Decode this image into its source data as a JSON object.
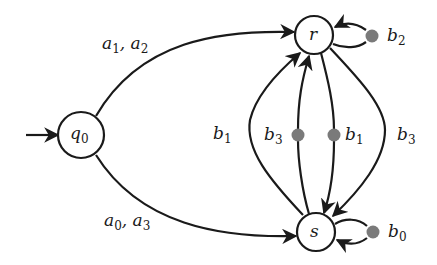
{
  "diagram": {
    "type": "state-transition-diagram",
    "colors": {
      "stroke": "#1a1a1a",
      "choice_dot": "#7a7a7a",
      "background": "#ffffff"
    },
    "nodes": [
      {
        "id": "q0",
        "label": "q",
        "sub": "0",
        "initial": true
      },
      {
        "id": "r",
        "label": "r",
        "sub": ""
      },
      {
        "id": "s",
        "label": "s",
        "sub": ""
      }
    ],
    "edges": [
      {
        "from": "q0",
        "to": "r",
        "label": "a",
        "label_text": "a1, a2",
        "parts": [
          {
            "l": "a",
            "s": "1"
          },
          {
            "l": "a",
            "s": "2"
          }
        ]
      },
      {
        "from": "q0",
        "to": "s",
        "label_text": "a0, a3",
        "parts": [
          {
            "l": "a",
            "s": "0"
          },
          {
            "l": "a",
            "s": "3"
          }
        ]
      },
      {
        "from": "s",
        "to": "r",
        "label_text": "b1",
        "parts": [
          {
            "l": "b",
            "s": "1"
          }
        ],
        "side": "left-outer"
      },
      {
        "from": "s",
        "to": "r",
        "label_text": "b3",
        "parts": [
          {
            "l": "b",
            "s": "3"
          }
        ],
        "via_choice_dot": true,
        "side": "left-inner"
      },
      {
        "from": "r",
        "to": "s",
        "label_text": "b1",
        "parts": [
          {
            "l": "b",
            "s": "1"
          }
        ],
        "via_choice_dot": true,
        "side": "right-inner"
      },
      {
        "from": "r",
        "to": "s",
        "label_text": "b3",
        "parts": [
          {
            "l": "b",
            "s": "3"
          }
        ],
        "side": "right-outer"
      },
      {
        "from": "r",
        "to": "r",
        "label_text": "b2",
        "parts": [
          {
            "l": "b",
            "s": "2"
          }
        ],
        "via_choice_dot": true,
        "self_loop": true
      },
      {
        "from": "s",
        "to": "s",
        "label_text": "b0",
        "parts": [
          {
            "l": "b",
            "s": "0"
          }
        ],
        "via_choice_dot": true,
        "self_loop": true
      }
    ]
  }
}
